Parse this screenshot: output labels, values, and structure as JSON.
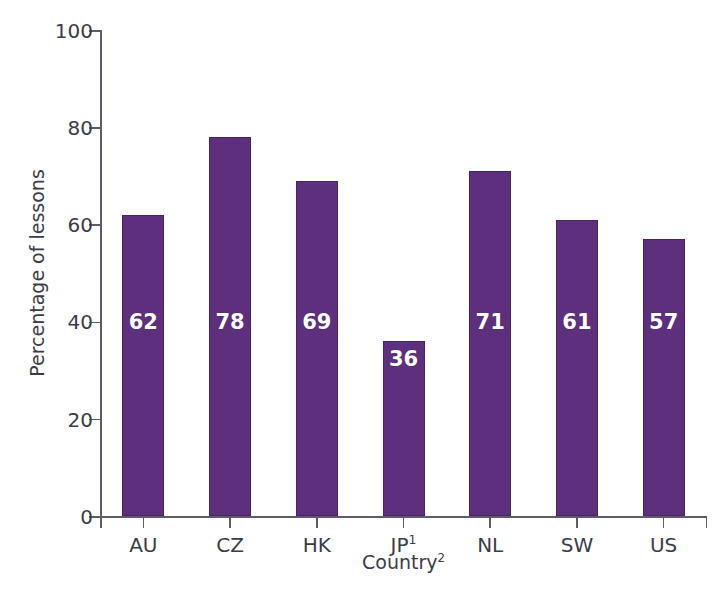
{
  "chart_data": {
    "type": "bar",
    "title": "",
    "subtitle": "",
    "categories": [
      "AU",
      "CZ",
      "HK",
      "JP",
      "NL",
      "SW",
      "US"
    ],
    "category_labels": [
      "AU",
      "CZ",
      "HK",
      "JP1",
      "NL",
      "SW",
      "US"
    ],
    "category_footnotes": [
      "",
      "",
      "",
      "1",
      "",
      "",
      ""
    ],
    "values": [
      62,
      78,
      69,
      36,
      71,
      61,
      57
    ],
    "value_labels": [
      "62",
      "78",
      "69",
      "36",
      "71",
      "61",
      "57"
    ],
    "xlabel": "Country",
    "xlabel_footnote": "2",
    "ylabel": "Percentage of lessons",
    "ylim": [
      0,
      100
    ],
    "yticks": [
      0,
      20,
      40,
      60,
      80,
      100
    ],
    "ytick_labels": [
      "0",
      "20",
      "40",
      "60",
      "80",
      "100"
    ],
    "grid": false,
    "legend": "none",
    "bar_color": "#5e2f7c",
    "bar_border_color": "#4a2462",
    "value_label_color": "#ffffff",
    "axis_color": "#5c5c6e",
    "text_color": "#3b3b4a",
    "background": "#ffffff"
  },
  "footer": {
    "caption_fragment": ""
  }
}
